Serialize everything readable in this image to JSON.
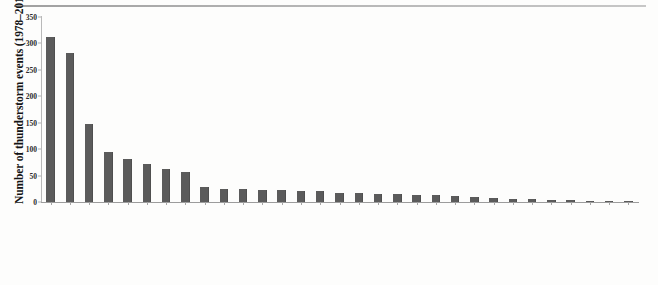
{
  "chart_data": {
    "type": "bar",
    "title": "",
    "xlabel": "",
    "ylabel": "Number of thunderstorm events (1978–2012)",
    "ylim": [
      0,
      350
    ],
    "ytick_values": [
      0,
      50,
      100,
      150,
      200,
      250,
      300,
      350
    ],
    "ytick_labels": [
      "0",
      "50",
      "100",
      "150",
      "200",
      "250",
      "300",
      "350"
    ],
    "grid": false,
    "legend": null,
    "bar_color": "#5b5b5b",
    "categories": [
      "West Bengal",
      "Assam",
      "Maharashtra",
      "Jharkhand",
      "Bihar",
      "Kerala",
      "Orissa",
      "Karnataka",
      "U.P.",
      "Tripura",
      "Himachal Pradesh",
      "Punjab",
      "Madhya Pradesh",
      "Haryana",
      "Andhra Pradesh",
      "Jammu & Kashmir",
      "Chhattisgarh",
      "Tamil Nadu",
      "Chandigarh",
      "Rajasthan",
      "Gujarat",
      "Meghalaya",
      "Manipur",
      "Delhi",
      "Arunachal Pradesh",
      "Mizoram",
      "Uttarakhand",
      "Sikkim",
      "Pondicherry",
      "Nagaland",
      "Goa"
    ],
    "values": [
      312,
      281,
      147,
      95,
      82,
      72,
      62,
      57,
      28,
      25,
      24,
      23,
      22,
      21,
      20,
      18,
      17,
      16,
      15,
      14,
      13,
      11,
      9,
      8,
      6,
      5,
      4,
      3,
      2,
      2,
      1
    ]
  },
  "axis": {
    "y_title": "Number of thunderstorm events (1978–2012)"
  }
}
